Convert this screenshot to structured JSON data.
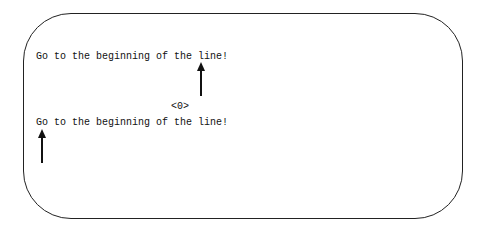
{
  "lines": [
    {
      "text": "Go to the beginning of the line!"
    },
    {
      "text": "Go to the beginning of the line!"
    }
  ],
  "marker": "<0>",
  "arrows": [
    {
      "label": "cursor-at-end-of-line"
    },
    {
      "label": "cursor-at-beginning-of-line"
    }
  ]
}
